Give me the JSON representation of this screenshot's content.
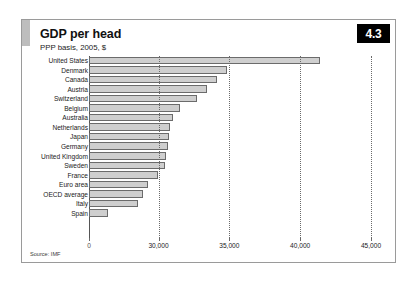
{
  "figure": {
    "badge": "4.3",
    "title": "GDP per head",
    "subtitle": "PPP basis, 2005, $",
    "source": "Source: IMF"
  },
  "axis": {
    "origin_label": "0",
    "ticks": [
      "30,000",
      "35,000",
      "40,000",
      "45,000"
    ]
  },
  "chart_data": {
    "type": "bar",
    "orientation": "horizontal",
    "title": "GDP per head",
    "subtitle": "PPP basis, 2005, $",
    "xlabel": "",
    "ylabel": "",
    "xlim": [
      25000,
      46000
    ],
    "axis_break": true,
    "grid": true,
    "gridlines": [
      30000,
      35000,
      40000,
      45000
    ],
    "tick_labels": [
      "0",
      "30,000",
      "35,000",
      "40,000",
      "45,000"
    ],
    "legend": null,
    "source": "Source: IMF",
    "categories": [
      "United States",
      "Denmark",
      "Canada",
      "Austria",
      "Switzerland",
      "Belgium",
      "Australia",
      "Netherlands",
      "Japan",
      "Germany",
      "United Kingdom",
      "Sweden",
      "France",
      "Euro area",
      "OECD average",
      "Italy",
      "Spain"
    ],
    "values": [
      41400,
      34800,
      34100,
      33400,
      32700,
      31500,
      31000,
      30800,
      30700,
      30600,
      30500,
      30400,
      29900,
      29200,
      28800,
      28500,
      26300
    ],
    "bar_px": [
      319.0,
      226.0,
      216.0,
      206.0,
      196.0,
      179.0,
      172.0,
      169.0,
      168.0,
      166.5,
      165.0,
      164.0,
      157.0,
      147.0,
      141.5,
      137.0,
      107.0
    ]
  }
}
